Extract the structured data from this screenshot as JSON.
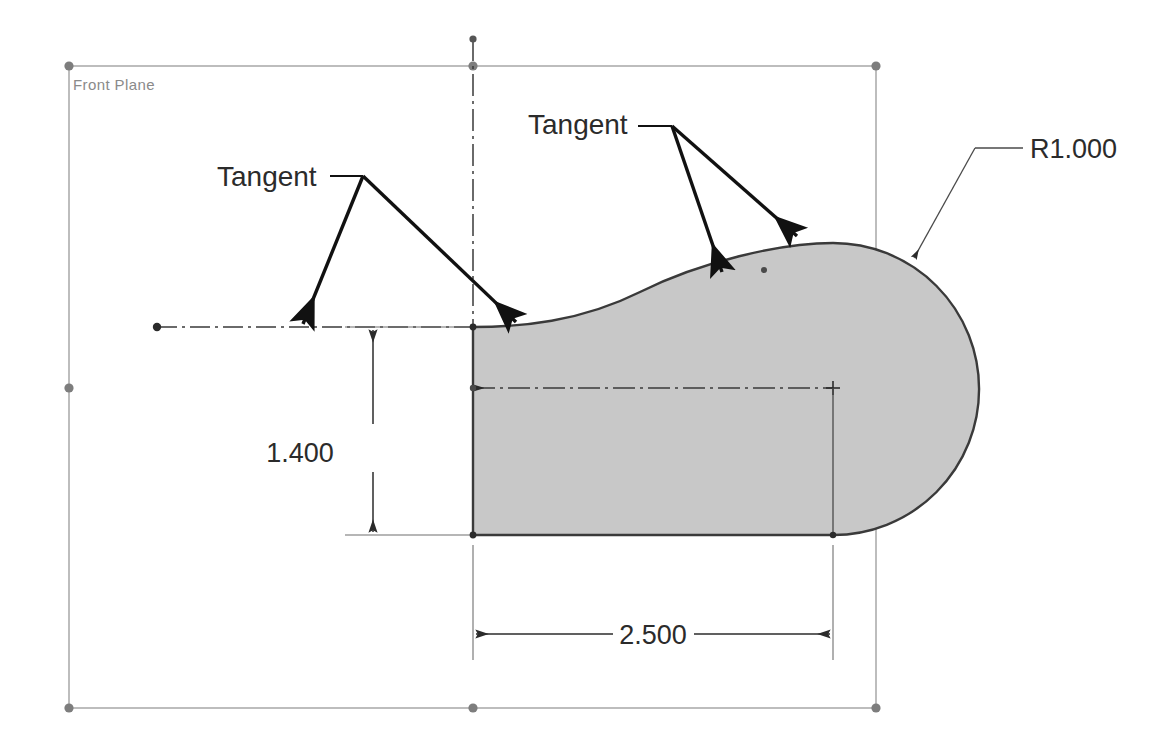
{
  "app": {
    "view_title": "Front Plane",
    "units": "inches",
    "background_color": "#ffffff"
  },
  "plane": {
    "label": "Front Plane",
    "label_color": "#8a8a8a",
    "border_color": "#9a9a9a",
    "handle_color": "#7d7d7d",
    "bounds": {
      "left": 69,
      "top": 66,
      "right": 876,
      "bottom": 708
    },
    "handles": [
      {
        "name": "plane-handle-top-left",
        "x": 69,
        "y": 66
      },
      {
        "name": "plane-handle-top-mid",
        "x": 473,
        "y": 66
      },
      {
        "name": "plane-handle-top-right",
        "x": 876,
        "y": 66
      },
      {
        "name": "plane-handle-left-mid",
        "x": 69,
        "y": 388
      },
      {
        "name": "plane-handle-right-mid",
        "x": 876,
        "y": 388
      },
      {
        "name": "plane-handle-bottom-left",
        "x": 69,
        "y": 708
      },
      {
        "name": "plane-handle-bottom-mid",
        "x": 473,
        "y": 708
      },
      {
        "name": "plane-handle-bottom-right",
        "x": 876,
        "y": 708
      }
    ]
  },
  "profile": {
    "fill_color": "#c8c8c8",
    "edge_color": "#3a3a3a",
    "left_edge_x": 473,
    "top_y": 327,
    "bottom_y": 535,
    "arc_center_x": 833,
    "arc_center_y": 388,
    "arc_radius_px": 145,
    "rightmost_x": 977
  },
  "centerlines": {
    "color": "#3a3a3a",
    "horizontal_left": {
      "x1": 157,
      "y1": 327,
      "x2": 473,
      "y2": 327
    },
    "horizontal_mid": {
      "x1": 473,
      "y1": 388,
      "x2": 833,
      "y2": 388
    },
    "vertical": {
      "x": 473,
      "y1": 39,
      "y2": 327
    },
    "endpoint_dot": {
      "x": 157,
      "y": 327
    },
    "arc_center_mark": {
      "x": 833,
      "y": 388
    }
  },
  "dimensions": [
    {
      "name": "vertical-height-dimension",
      "value": "1.400",
      "type": "linear-vertical",
      "dim_line_x": 373,
      "from_y": 327,
      "to_y": 535,
      "text_x": 300,
      "text_y": 453,
      "ext_left_x": 345,
      "ext_right_x": 473
    },
    {
      "name": "horizontal-length-dimension",
      "value": "2.500",
      "type": "linear-horizontal",
      "dim_line_y": 634,
      "from_x": 473,
      "to_x": 833,
      "text_x": 653,
      "text_y": 644,
      "ext_top_y": 545,
      "ext_bottom_y": 660
    },
    {
      "name": "radius-dimension",
      "value": "R1.000",
      "type": "radius",
      "text_x": 1035,
      "text_y": 158,
      "leader_elbow": {
        "x1": 1023,
        "y1": 148,
        "x2": 975,
        "y2": 148
      },
      "leader_line": {
        "x1": 975,
        "y1": 148,
        "x2": 917,
        "y2": 251
      },
      "arrow_tip": {
        "x": 912,
        "y": 262
      }
    }
  ],
  "annotations": [
    {
      "name": "tangent-callout-left",
      "label": "Tangent",
      "text_x": 217,
      "text_y": 186,
      "elbow": {
        "x1": 330,
        "y1": 176,
        "x2": 363,
        "y2": 176
      },
      "arrows": [
        {
          "from_x": 363,
          "from_y": 176,
          "to_x": 302,
          "to_y": 330
        },
        {
          "from_x": 363,
          "from_y": 176,
          "to_x": 519,
          "to_y": 327
        }
      ]
    },
    {
      "name": "tangent-callout-right",
      "label": "Tangent",
      "text_x": 528,
      "text_y": 134,
      "elbow": {
        "x1": 638,
        "y1": 126,
        "x2": 672,
        "y2": 126
      },
      "arrows": [
        {
          "from_x": 672,
          "from_y": 126,
          "to_x": 724,
          "to_y": 276
        },
        {
          "from_x": 672,
          "from_y": 126,
          "to_x": 800,
          "to_y": 239
        }
      ]
    }
  ]
}
